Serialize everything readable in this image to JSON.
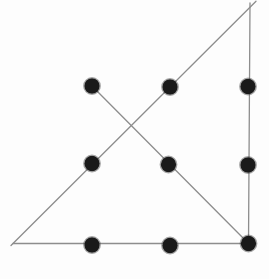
{
  "figure": {
    "kind": "nine-dots-puzzle-solution",
    "canvas": {
      "width": 269,
      "height": 279,
      "background": "#fdfdfd"
    },
    "style": {
      "dot_color": "#1a1a1a",
      "dot_radius": 7.7,
      "dot_edge_blur_color": "#3a3a3a",
      "line_color": "#8d8d8d",
      "line_width": 1.3
    },
    "dots": [
      {
        "name": "dot-top-left",
        "x": 92,
        "y": 86
      },
      {
        "name": "dot-top-middle",
        "x": 170,
        "y": 87
      },
      {
        "name": "dot-top-right",
        "x": 248,
        "y": 86.5
      },
      {
        "name": "dot-middle-left",
        "x": 92,
        "y": 163.5
      },
      {
        "name": "dot-center",
        "x": 168.5,
        "y": 164.5
      },
      {
        "name": "dot-middle-right",
        "x": 248,
        "y": 165
      },
      {
        "name": "dot-bottom-left",
        "x": 92,
        "y": 245
      },
      {
        "name": "dot-bottom-middle",
        "x": 170,
        "y": 245.5
      },
      {
        "name": "dot-bottom-right",
        "x": 248.5,
        "y": 243.5
      }
    ],
    "lines": [
      {
        "name": "line-diagonal-topleft-to-bottomright",
        "x1": 92,
        "y1": 86,
        "x2": 248.5,
        "y2": 243.5
      },
      {
        "name": "line-vertical-right",
        "x1": 250,
        "y1": 3,
        "x2": 248.5,
        "y2": 243.5
      },
      {
        "name": "line-diagonal-apex-to-bottomleft",
        "x1": 256,
        "y1": 1.2,
        "x2": 11,
        "y2": 245.5
      },
      {
        "name": "line-horizontal-bottom",
        "x1": 13,
        "y1": 243.5,
        "x2": 248.5,
        "y2": 243.5
      }
    ]
  }
}
